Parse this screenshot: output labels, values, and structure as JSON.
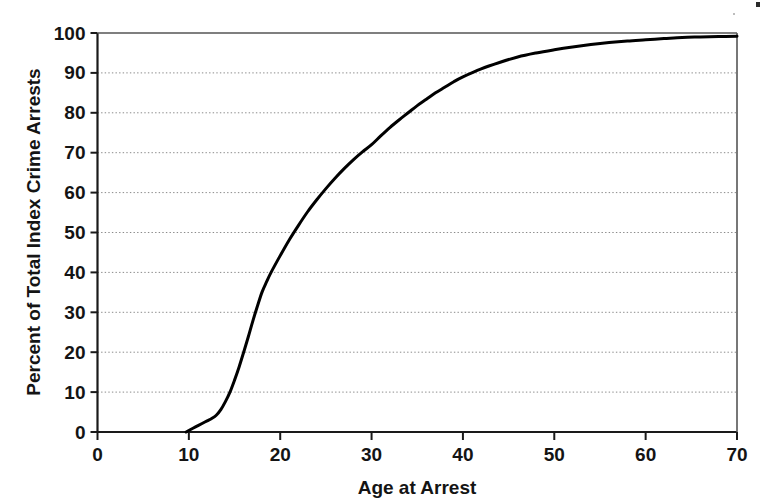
{
  "chart_data": {
    "type": "line",
    "title": "",
    "subtitle": "",
    "xlabel": "Age at Arrest",
    "ylabel": "Percent of Total Index Crime Arrests",
    "xlim": [
      0,
      70
    ],
    "ylim": [
      0,
      100
    ],
    "xticks": [
      0,
      10,
      20,
      30,
      40,
      50,
      60,
      70
    ],
    "yticks": [
      0,
      10,
      20,
      30,
      40,
      50,
      60,
      70,
      80,
      90,
      100
    ],
    "xtick_labels": [
      "0",
      "10",
      "20",
      "30",
      "40",
      "50",
      "60",
      "70"
    ],
    "ytick_labels": [
      "0",
      "10",
      "20",
      "30",
      "40",
      "50",
      "60",
      "70",
      "80",
      "90",
      "100"
    ],
    "grid": "horizontal-dotted",
    "legend": "none",
    "series": [
      {
        "name": "Cumulative percent of total index crime arrests",
        "color": "#000000",
        "x": [
          9.7,
          10.5,
          11.0,
          11.5,
          12.0,
          12.5,
          13.0,
          13.5,
          14.0,
          14.5,
          15.0,
          15.5,
          16.0,
          16.5,
          17.0,
          17.5,
          18.0,
          18.5,
          19.0,
          20.0,
          21.0,
          22.0,
          23.0,
          24.0,
          25.0,
          26.0,
          27.0,
          28.0,
          29.0,
          30.0,
          31.0,
          32.0,
          33.0,
          34.0,
          35.0,
          36.0,
          37.0,
          38.0,
          39.0,
          40.0,
          42.0,
          44.0,
          46.0,
          48.0,
          50.0,
          52.0,
          54.0,
          56.0,
          58.0,
          60.0,
          62.0,
          64.0,
          66.0,
          68.0,
          70.0
        ],
        "y": [
          0.0,
          1.0,
          1.6,
          2.2,
          2.8,
          3.4,
          4.2,
          5.6,
          7.6,
          10.0,
          13.0,
          16.3,
          20.0,
          23.8,
          27.8,
          31.5,
          35.0,
          37.6,
          40.0,
          44.2,
          48.2,
          51.8,
          55.2,
          58.2,
          61.0,
          63.6,
          66.0,
          68.2,
          70.2,
          72.0,
          74.2,
          76.3,
          78.2,
          80.0,
          81.8,
          83.4,
          85.0,
          86.4,
          87.8,
          89.0,
          91.0,
          92.6,
          94.0,
          95.0,
          95.8,
          96.5,
          97.1,
          97.6,
          98.0,
          98.3,
          98.6,
          98.9,
          99.0,
          99.1,
          99.2
        ]
      }
    ],
    "annotations": []
  },
  "axes": {
    "x_axis_title": "Age at Arrest",
    "y_axis_title": "Percent of Total Index Crime Arrests"
  },
  "colors": {
    "line": "#000000",
    "axis": "#1a1a1a",
    "grid": "#8a8a8a",
    "background": "#ffffff"
  }
}
